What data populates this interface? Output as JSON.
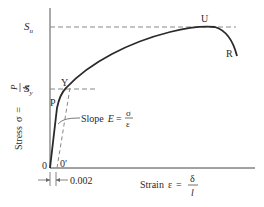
{
  "diagram": {
    "type": "stress-strain curve",
    "y_axis_label": {
      "prefix": "Stress",
      "symbol": "σ",
      "equals": "=",
      "numerator": "P",
      "denominator": "A"
    },
    "x_axis_label": {
      "prefix": "Strain",
      "symbol": "ε",
      "equals": "=",
      "numerator": "δ",
      "denominator": "l"
    },
    "levels": {
      "ultimate": "S",
      "ultimate_sub": "u",
      "yield": "S",
      "yield_sub": "y"
    },
    "points": {
      "origin": "0",
      "offset_origin": "0′",
      "proportional": "P",
      "yield": "Y",
      "ultimate": "U",
      "rupture": "R"
    },
    "slope_label": {
      "prefix": "Slope",
      "symbol": "E",
      "equals": "=",
      "numerator": "σ",
      "denominator": "ε"
    },
    "offset_value": "0.002",
    "colors": {
      "line": "#2a2a2a",
      "dashed": "#888888"
    }
  }
}
